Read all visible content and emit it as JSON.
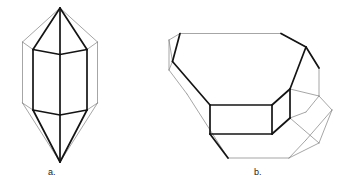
{
  "figure": {
    "type": "line-drawing",
    "background_color": "#ffffff",
    "stroke_color_heavy": "#111111",
    "stroke_color_light": "#777777",
    "stroke_width_heavy": 1.7,
    "stroke_width_light": 0.6,
    "canvas": {
      "width": 355,
      "height": 189
    }
  },
  "labels": {
    "a": "a.",
    "b": "b."
  },
  "crystal_a": {
    "name": "bipyramidal-hexagonal-prism",
    "description": "Upright hexagonal prism terminated top and bottom by hexagonal pyramids",
    "apex_top": [
      60,
      8
    ],
    "apex_bottom": [
      60,
      162
    ],
    "heavy_polylines": [
      "60,8 33,49",
      "60,8 87,49",
      "60,8 60,54",
      "33,49 33,110",
      "87,49 87,110",
      "60,54 60,115",
      "33,49 60,54 87,49",
      "33,110 60,115 87,110",
      "60,115 60,162",
      "33,110 60,162",
      "87,110 60,162"
    ],
    "light_polylines": [
      "60,8 23,42",
      "60,8 97,42",
      "23,42 23,103",
      "97,42 97,103",
      "23,42 33,49",
      "97,42 87,49",
      "23,103 33,110",
      "97,103 87,110",
      "23,103 60,162",
      "97,103 60,162"
    ]
  },
  "crystal_b": {
    "name": "tilted-hexagonal-prism",
    "description": "Hexagonal prism lying on its side, tilted, with beveled terminations at both ends",
    "heavy_polylines": [
      "180,34 172,62",
      "172,62 210,105",
      "210,105 272,105",
      "272,105 290,89",
      "290,89 305,47",
      "305,47 280,34",
      "210,105 210,134",
      "210,134 272,134",
      "272,134 290,118",
      "290,118 290,89",
      "272,105 272,134",
      "210,134 228,158",
      "228,158 288,158",
      "305,47 318,68",
      "318,68 318,96",
      "318,96 305,112"
    ],
    "light_polylines": [
      "180,34 280,34",
      "280,34 305,47",
      "305,47 318,68",
      "318,68 318,96",
      "318,96 331,110",
      "180,34 169,40",
      "169,40 169,70",
      "169,70 172,62",
      "169,70 186,93",
      "186,93 228,158",
      "228,158 288,158",
      "288,158 318,143",
      "318,143 331,110",
      "290,118 318,143",
      "290,89 318,96",
      "331,110 318,96",
      "169,40 172,62",
      "288,158 305,140",
      "305,140 331,110",
      "305,112 318,96",
      "290,118 305,112"
    ]
  }
}
